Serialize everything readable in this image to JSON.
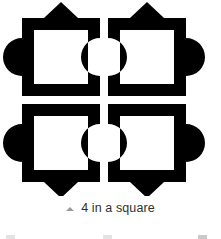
{
  "figure": {
    "caption": "4 in a square",
    "marker_icon": "triangle-up-icon",
    "marker_color": "#9a9a9a",
    "caption_color": "#2f2f2f",
    "background_color": "#ffffff",
    "shape_color": "#000000",
    "tile_count": 4,
    "tiles": [
      {
        "name": "top-left",
        "point_direction": "up",
        "bump_side": "left",
        "frame_x": 22,
        "frame_y": 18,
        "frame_size": 78,
        "border_thickness": 12
      },
      {
        "name": "top-right",
        "point_direction": "up",
        "bump_side": "right",
        "frame_x": 108,
        "frame_y": 18,
        "frame_size": 78,
        "border_thickness": 12
      },
      {
        "name": "bottom-left",
        "point_direction": "down",
        "bump_side": "left",
        "frame_x": 22,
        "frame_y": 104,
        "frame_size": 78,
        "border_thickness": 12
      },
      {
        "name": "bottom-right",
        "point_direction": "down",
        "bump_side": "right",
        "frame_x": 108,
        "frame_y": 104,
        "frame_size": 78,
        "border_thickness": 12
      }
    ]
  }
}
